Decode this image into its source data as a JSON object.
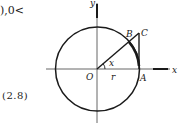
{
  "text_fragments": {
    "top_right_fragment": "),0<",
    "bottom_left_fragment": "(2.8)"
  },
  "diagram": {
    "type": "unit-circle-tangent-figure",
    "axes": {
      "x_label": "x",
      "y_label": "y"
    },
    "points": {
      "origin": "O",
      "A": "A",
      "B": "B",
      "C": "C"
    },
    "angle_label": "x",
    "radius_label": "r",
    "colors": {
      "stroke": "#1a1a1a",
      "background": "#ffffff"
    }
  }
}
